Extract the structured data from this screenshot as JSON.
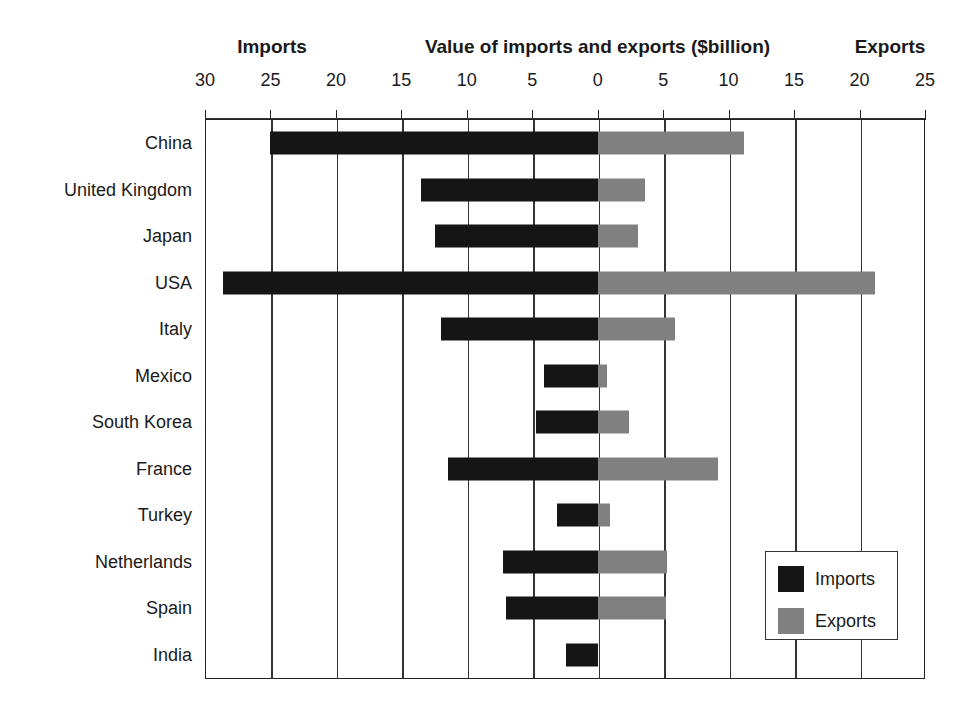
{
  "header": {
    "imports_side_label": "Imports",
    "title": "Value of imports and exports ($billion)",
    "exports_side_label": "Exports"
  },
  "axis": {
    "tick_labels": [
      "30",
      "25",
      "20",
      "15",
      "10",
      "5",
      "0",
      "5",
      "10",
      "15",
      "20",
      "25"
    ],
    "tick_values": [
      -30,
      -25,
      -20,
      -15,
      -10,
      -5,
      0,
      5,
      10,
      15,
      20,
      25
    ]
  },
  "legend": {
    "entries": [
      {
        "label": "Imports",
        "color": "#151515"
      },
      {
        "label": "Exports",
        "color": "#808080"
      }
    ]
  },
  "chart_data": {
    "type": "bar",
    "orientation": "horizontal",
    "style": "bidirectional-diverging",
    "title": "Value of imports and exports ($billion)",
    "xlabel": "Value of imports and exports ($billion)",
    "ylabel": "",
    "xlim": [
      -30,
      25
    ],
    "xtick_labels": [
      "30",
      "25",
      "20",
      "15",
      "10",
      "5",
      "0",
      "5",
      "10",
      "15",
      "20",
      "25"
    ],
    "grid": true,
    "legend_position": "bottom-right",
    "units": "$billion",
    "categories": [
      "China",
      "United Kingdom",
      "Japan",
      "USA",
      "Italy",
      "Mexico",
      "South Korea",
      "France",
      "Turkey",
      "Netherlands",
      "Spain",
      "India"
    ],
    "series": [
      {
        "name": "Imports",
        "color": "#151515",
        "direction": "left",
        "values": [
          25.0,
          13.5,
          12.4,
          28.6,
          12.0,
          4.1,
          4.7,
          11.4,
          3.1,
          7.2,
          7.0,
          2.4
        ]
      },
      {
        "name": "Exports",
        "color": "#808080",
        "direction": "right",
        "values": [
          11.2,
          3.6,
          3.1,
          21.2,
          5.9,
          0.7,
          2.4,
          9.2,
          0.9,
          5.3,
          5.2,
          0.0
        ]
      }
    ]
  }
}
